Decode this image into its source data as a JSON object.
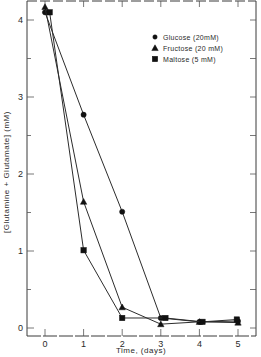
{
  "chart_data": {
    "type": "line",
    "title": "",
    "xlabel": "Time, (days)",
    "ylabel": "[Glutamine + Glutamate] (mM)",
    "xlim": [
      -0.45,
      5.5
    ],
    "ylim": [
      -0.1,
      4.25
    ],
    "x_ticks": [
      0,
      1,
      2,
      3,
      4,
      5
    ],
    "x_tick_labels": [
      "0",
      "1",
      "2",
      "3",
      "4",
      "5"
    ],
    "y_ticks": [
      0,
      1,
      2,
      3,
      4
    ],
    "y_tick_labels": [
      "0",
      "1",
      "2",
      "3",
      "4"
    ],
    "y_minor_step": 0.5,
    "grid": false,
    "legend_position": "top-right",
    "series": [
      {
        "name": "Glucose (20mM)",
        "marker": "circle",
        "x": [
          0,
          1,
          2,
          3,
          4,
          5
        ],
        "values": [
          4.1,
          2.77,
          1.51,
          0.13,
          0.08,
          0.09
        ]
      },
      {
        "name": "Fructose (20 mM)",
        "marker": "triangle",
        "x": [
          0,
          1,
          2,
          3,
          4,
          5
        ],
        "values": [
          4.17,
          1.64,
          0.27,
          0.05,
          0.08,
          0.07
        ]
      },
      {
        "name": "Maltose (5 mM)",
        "marker": "square",
        "x": [
          0.12,
          1,
          2,
          3.12,
          4.08,
          4.97
        ],
        "values": [
          4.1,
          1.01,
          0.13,
          0.13,
          0.08,
          0.11
        ]
      }
    ]
  }
}
